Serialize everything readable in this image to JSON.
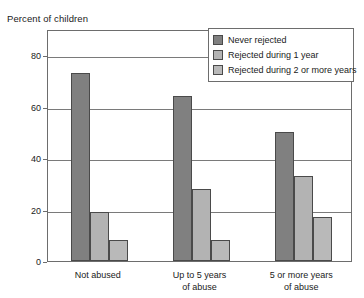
{
  "chart_data": {
    "type": "bar",
    "title": "Percent of children",
    "xlabel": "",
    "ylabel": "Percent of children",
    "ylim": [
      0,
      80
    ],
    "yticks": [
      0,
      20,
      40,
      60,
      80
    ],
    "ytick_labels": [
      "0",
      "20",
      "40",
      "60",
      "80"
    ],
    "grid": true,
    "legend_position": "top-right",
    "categories": [
      "Not abused",
      "Up to 5 years\nof abuse",
      "5 or more years\nof abuse"
    ],
    "series": [
      {
        "name": "Never rejected",
        "color": "#808080",
        "values": [
          73,
          64,
          50
        ]
      },
      {
        "name": "Rejected during 1 year",
        "color": "#b3b3b3",
        "values": [
          19,
          28,
          33
        ]
      },
      {
        "name": "Rejected during 2 or more years",
        "color": "#b9b9b9",
        "values": [
          8,
          8,
          17
        ]
      }
    ]
  },
  "legend": {
    "entries": [
      {
        "label": "Never rejected",
        "color": "#808080"
      },
      {
        "label": "Rejected during 1 year",
        "color": "#b3b3b3"
      },
      {
        "label": "Rejected during 2 or more years",
        "color": "#b9b9b9"
      }
    ]
  },
  "colors": {
    "frame": "#6d6d6d",
    "gridline": "#7a7a7a",
    "bar_border": "#4a4a4a",
    "text": "#1a1a1a",
    "background": "#ffffff"
  }
}
